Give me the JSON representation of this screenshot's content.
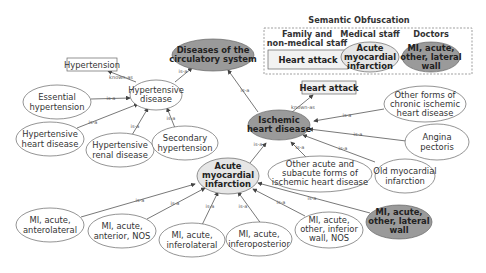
{
  "legend": {
    "title": "Semantic Obfuscation",
    "columns": [
      {
        "header_line1": "Family and",
        "header_line2": "non-medical staff",
        "term": "Heart attack"
      },
      {
        "header_line1": "Medical staff",
        "term_lines": [
          "Acute",
          "myocardial",
          "infarction"
        ]
      },
      {
        "header_line1": "Doctors",
        "term_lines": [
          "MI, acute,",
          "other, lateral",
          "wall"
        ]
      }
    ]
  },
  "nodes": {
    "diseases_circulatory": {
      "lines": [
        "Diseases of the",
        "circulatory system"
      ],
      "style": "dark-ellipse"
    },
    "hypertensive_disease": {
      "lines": [
        "Hypertensive",
        "disease"
      ],
      "style": "ellipse"
    },
    "hypertension_box": {
      "label": "Hypertension",
      "style": "box"
    },
    "essential_hypertension": {
      "lines": [
        "Essential",
        "hypertension"
      ],
      "style": "ellipse"
    },
    "hypertensive_heart": {
      "lines": [
        "Hypertensive",
        "heart disease"
      ],
      "style": "ellipse"
    },
    "hypertensive_renal": {
      "lines": [
        "Hypertensive",
        "renal disease"
      ],
      "style": "ellipse"
    },
    "secondary_hypertension": {
      "lines": [
        "Secondary",
        "hypertension"
      ],
      "style": "ellipse"
    },
    "ischemic_heart": {
      "lines": [
        "Ischemic",
        "heart disease"
      ],
      "style": "dark-ellipse"
    },
    "heart_attack_box": {
      "label": "Heart attack",
      "style": "box"
    },
    "other_chronic": {
      "lines": [
        "Other forms of",
        "chronic ischemic",
        "heart disease"
      ],
      "style": "ellipse"
    },
    "angina": {
      "lines": [
        "Angina",
        "pectoris"
      ],
      "style": "ellipse"
    },
    "old_mi": {
      "lines": [
        "Old myocardial",
        "infarction"
      ],
      "style": "ellipse"
    },
    "other_acute_subacute": {
      "lines": [
        "Other acute and",
        "subacute forms of",
        "ischemic heart disease"
      ],
      "style": "ellipse"
    },
    "acute_mi": {
      "lines": [
        "Acute",
        "myocardial",
        "infarction"
      ],
      "style": "light-ellipse"
    },
    "mi_anterolateral": {
      "lines": [
        "MI, acute,",
        "anterolateral"
      ],
      "style": "ellipse"
    },
    "mi_anterior": {
      "lines": [
        "MI, acute,",
        "anterior, NOS"
      ],
      "style": "ellipse"
    },
    "mi_inferolateral": {
      "lines": [
        "MI, acute,",
        "inferolateral"
      ],
      "style": "ellipse"
    },
    "mi_inferoposterior": {
      "lines": [
        "MI, acute,",
        "inferoposterior"
      ],
      "style": "ellipse"
    },
    "mi_inferior": {
      "lines": [
        "MI, acute,",
        "other, inferior",
        "wall, NOS"
      ],
      "style": "ellipse"
    },
    "mi_lateral": {
      "lines": [
        "MI, acute,",
        "other, lateral",
        "wall"
      ],
      "style": "dark-ellipse"
    }
  },
  "edge_labels": {
    "is_a": "is-a",
    "known_as": "known-as"
  },
  "colors": {
    "dark_fill": "#9a9a9a",
    "light_fill": "#e6e6e6",
    "box_fill": "#f2f2f2",
    "stroke": "#555555"
  }
}
